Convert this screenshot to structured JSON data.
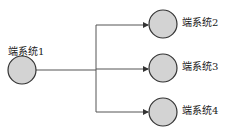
{
  "diagram": {
    "type": "one-to-many broadcast",
    "nodes": [
      {
        "id": "n1",
        "label": "端系统1"
      },
      {
        "id": "n2",
        "label": "端系统2"
      },
      {
        "id": "n3",
        "label": "端系统3"
      },
      {
        "id": "n4",
        "label": "端系统4"
      }
    ],
    "edges": [
      {
        "from": "n1",
        "to": "n2"
      },
      {
        "from": "n1",
        "to": "n3"
      },
      {
        "from": "n1",
        "to": "n4"
      }
    ],
    "colors": {
      "node_fill": "#d3d3d3",
      "node_stroke": "#333333",
      "line": "#555555"
    }
  }
}
